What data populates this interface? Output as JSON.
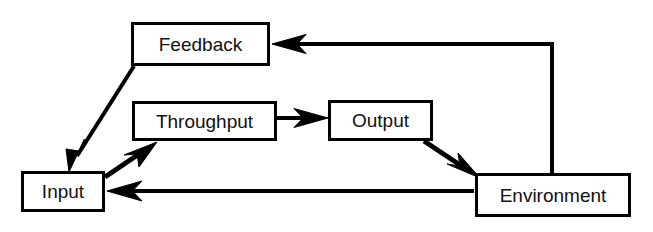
{
  "diagram": {
    "type": "flow-diagram",
    "background_color": "#ffffff",
    "stroke_color": "#000000",
    "text_color": "#111111",
    "canvas": {
      "width": 653,
      "height": 232
    },
    "nodes": [
      {
        "id": "feedback",
        "label": "Feedback",
        "x": 131,
        "y": 22,
        "width": 139,
        "height": 44,
        "border_width": 3
      },
      {
        "id": "throughput",
        "label": "Throughput",
        "x": 132,
        "y": 101,
        "width": 145,
        "height": 40,
        "border_width": 3
      },
      {
        "id": "output",
        "label": "Output",
        "x": 328,
        "y": 100,
        "width": 105,
        "height": 41,
        "border_width": 3
      },
      {
        "id": "input",
        "label": "Input",
        "x": 21,
        "y": 171,
        "width": 84,
        "height": 41,
        "border_width": 3
      },
      {
        "id": "environment",
        "label": "Environment",
        "x": 475,
        "y": 173,
        "width": 156,
        "height": 44,
        "border_width": 3
      }
    ],
    "edges": [
      {
        "id": "environment-to-feedback",
        "from": "environment",
        "to": "feedback",
        "kind": "orthogonal",
        "points": "552,173 552,44 274,44",
        "stroke_width": 4,
        "arrow_at": "feedback"
      },
      {
        "id": "feedback-to-input",
        "from": "feedback",
        "to": "input",
        "kind": "diagonal",
        "points": "134,66 70,172",
        "stroke_width": 4,
        "arrow_at": "input"
      },
      {
        "id": "input-to-throughput",
        "from": "input",
        "to": "throughput",
        "kind": "diagonal",
        "points": "105,176 156,142",
        "stroke_width": 5,
        "arrow_at": "throughput"
      },
      {
        "id": "throughput-to-output",
        "from": "throughput",
        "to": "output",
        "kind": "straight",
        "points": "277,118 327,118",
        "stroke_width": 4,
        "arrow_at": "output"
      },
      {
        "id": "output-to-environment",
        "from": "output",
        "to": "environment",
        "kind": "diagonal",
        "points": "424,141 479,177",
        "stroke_width": 5,
        "arrow_at": "environment"
      },
      {
        "id": "environment-to-input",
        "from": "environment",
        "to": "input",
        "kind": "straight",
        "points": "474,191 108,191",
        "stroke_width": 4,
        "arrow_at": "input"
      }
    ]
  }
}
